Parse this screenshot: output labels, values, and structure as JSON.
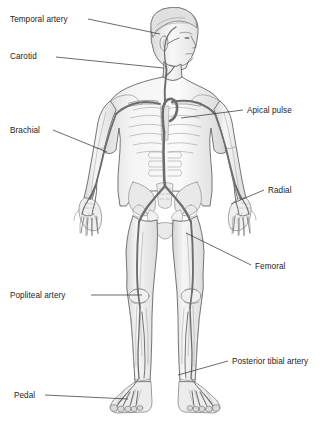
{
  "diagram": {
    "background_color": "#ffffff",
    "ink_color": "#1d1d1d",
    "artery_color": "#6d6d6d",
    "skin_fill": "#f2f2f2",
    "bone_fill": "#e8e8e8",
    "leader_color": "#3a3a3a"
  },
  "labels": [
    {
      "id": "temporal-artery",
      "text": "Temporal artery",
      "x": 10,
      "y": 15,
      "align": "left"
    },
    {
      "id": "carotid",
      "text": "Carotid",
      "x": 10,
      "y": 52,
      "align": "left"
    },
    {
      "id": "brachial",
      "text": "Brachial",
      "x": 10,
      "y": 126,
      "align": "left"
    },
    {
      "id": "popliteal-artery",
      "text": "Popliteal artery",
      "x": 10,
      "y": 291,
      "align": "left"
    },
    {
      "id": "pedal",
      "text": "Pedal",
      "x": 14,
      "y": 391,
      "align": "left"
    },
    {
      "id": "apical-pulse",
      "text": "Apical pulse",
      "x": 247,
      "y": 106,
      "align": "left"
    },
    {
      "id": "radial",
      "text": "Radial",
      "x": 268,
      "y": 186,
      "align": "left"
    },
    {
      "id": "femoral",
      "text": "Femoral",
      "x": 255,
      "y": 262,
      "align": "left"
    },
    {
      "id": "posterior-tibial-artery",
      "text": "Posterior tibial artery",
      "x": 232,
      "y": 357,
      "align": "left"
    }
  ],
  "leader_lines": [
    {
      "id": "leader-temporal-artery",
      "x1": 88,
      "y1": 19,
      "x2": 160,
      "y2": 34
    },
    {
      "id": "leader-carotid",
      "x1": 56,
      "y1": 57,
      "x2": 163,
      "y2": 68
    },
    {
      "id": "leader-brachial",
      "x1": 53,
      "y1": 130,
      "x2": 107,
      "y2": 152
    },
    {
      "id": "leader-popliteal-artery",
      "x1": 91,
      "y1": 295,
      "x2": 142,
      "y2": 295
    },
    {
      "id": "leader-pedal",
      "x1": 45,
      "y1": 395,
      "x2": 128,
      "y2": 399
    },
    {
      "id": "leader-apical-pulse",
      "x1": 243,
      "y1": 110,
      "x2": 181,
      "y2": 118
    },
    {
      "id": "leader-radial",
      "x1": 264,
      "y1": 190,
      "x2": 231,
      "y2": 204
    },
    {
      "id": "leader-femoral",
      "x1": 251,
      "y1": 265,
      "x2": 186,
      "y2": 233
    },
    {
      "id": "leader-posterior-tibial-artery",
      "x1": 228,
      "y1": 361,
      "x2": 178,
      "y2": 375
    }
  ]
}
